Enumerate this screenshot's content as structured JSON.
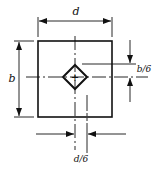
{
  "diagram": {
    "title": "",
    "labels": {
      "width": "d",
      "height": "b",
      "offset_vertical": "b/6",
      "offset_horizontal": "d/6"
    },
    "center_mark": "+",
    "colors": {
      "line": "#111111",
      "background": "#ffffff"
    }
  }
}
